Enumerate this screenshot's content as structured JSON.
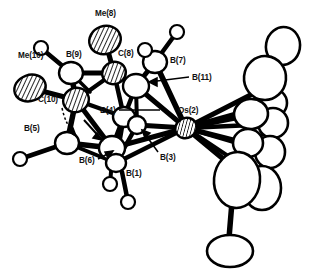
{
  "figure": {
    "name": "ortep-crystal-structure-diagram",
    "type": "molecular-structure-ortep",
    "background_color": "#ffffff",
    "line_color": "#000000",
    "caption": ""
  },
  "atom_labels": [
    {
      "id": "me8",
      "text": "Me(8)",
      "x": 95,
      "y": 16
    },
    {
      "id": "me10",
      "text": "Me(10)",
      "x": 18,
      "y": 58
    },
    {
      "id": "b9",
      "text": "B(9)",
      "x": 66,
      "y": 57
    },
    {
      "id": "c8",
      "text": "C(8)",
      "x": 118,
      "y": 56
    },
    {
      "id": "b7",
      "text": "B(7)",
      "x": 170,
      "y": 63
    },
    {
      "id": "b11",
      "text": "B(11)",
      "x": 192,
      "y": 80
    },
    {
      "id": "c10",
      "text": "C(10)",
      "x": 38,
      "y": 102
    },
    {
      "id": "b4",
      "text": "B(4)",
      "x": 100,
      "y": 113
    },
    {
      "id": "os2",
      "text": "Os(2)",
      "x": 178,
      "y": 113
    },
    {
      "id": "b5",
      "text": "B(5)",
      "x": 24,
      "y": 131
    },
    {
      "id": "b3",
      "text": "B(3)",
      "x": 160,
      "y": 160
    },
    {
      "id": "b6",
      "text": "B(6)",
      "x": 79,
      "y": 163
    },
    {
      "id": "b1",
      "text": "B(1)",
      "x": 126,
      "y": 176
    }
  ],
  "atoms": {
    "cage_boron": [
      {
        "id": "B9",
        "cx": 71,
        "cy": 73,
        "rx": 12,
        "ry": 11
      },
      {
        "id": "B7",
        "cx": 155,
        "cy": 62,
        "rx": 12,
        "ry": 11
      },
      {
        "id": "B11",
        "cx": 136,
        "cy": 86,
        "rx": 13,
        "ry": 12
      },
      {
        "id": "B4",
        "cx": 124,
        "cy": 117,
        "rx": 11,
        "ry": 10
      },
      {
        "id": "B5",
        "cx": 67,
        "cy": 143,
        "rx": 12,
        "ry": 11
      },
      {
        "id": "B6",
        "cx": 112,
        "cy": 148,
        "rx": 13,
        "ry": 12
      },
      {
        "id": "B1",
        "cx": 116,
        "cy": 163,
        "rx": 10,
        "ry": 9
      },
      {
        "id": "B3",
        "cx": 137,
        "cy": 125,
        "rx": 9,
        "ry": 9
      }
    ],
    "hatched_carbon": [
      {
        "id": "Me8",
        "cx": 105,
        "cy": 40,
        "rx": 16,
        "ry": 14,
        "rot": -20
      },
      {
        "id": "C8",
        "cx": 114,
        "cy": 73,
        "rx": 12,
        "ry": 11,
        "rot": -25
      },
      {
        "id": "Me10",
        "cx": 30,
        "cy": 88,
        "rx": 16,
        "ry": 13,
        "rot": -20
      },
      {
        "id": "C10",
        "cx": 76,
        "cy": 100,
        "rx": 13,
        "ry": 12,
        "rot": -25
      }
    ],
    "metal": {
      "id": "Os2",
      "cx": 186,
      "cy": 128,
      "rx": 11,
      "ry": 10,
      "rot": -30
    },
    "hydrogens": [
      {
        "id": "H-B9",
        "cx": 41,
        "cy": 48
      },
      {
        "id": "H-B7a",
        "cx": 177,
        "cy": 32
      },
      {
        "id": "H-B7b",
        "cx": 145,
        "cy": 50
      },
      {
        "id": "H-B5",
        "cx": 20,
        "cy": 159
      },
      {
        "id": "H-B6",
        "cx": 110,
        "cy": 184
      },
      {
        "id": "H-B1",
        "cx": 128,
        "cy": 202
      }
    ],
    "ligand_ellipsoids": [
      {
        "id": "L1",
        "cx": 283,
        "cy": 46,
        "rx": 17,
        "ry": 19,
        "rot": 10
      },
      {
        "id": "L2",
        "cx": 265,
        "cy": 78,
        "rx": 21,
        "ry": 22,
        "rot": 5
      },
      {
        "id": "L3",
        "cx": 271,
        "cy": 103,
        "rx": 16,
        "ry": 15,
        "rot": 0
      },
      {
        "id": "L4",
        "cx": 251,
        "cy": 114,
        "rx": 17,
        "ry": 15,
        "rot": -5
      },
      {
        "id": "L5",
        "cx": 273,
        "cy": 123,
        "rx": 15,
        "ry": 15,
        "rot": 0
      },
      {
        "id": "L6",
        "cx": 248,
        "cy": 143,
        "rx": 15,
        "ry": 14,
        "rot": 0
      },
      {
        "id": "L7",
        "cx": 270,
        "cy": 152,
        "rx": 15,
        "ry": 16,
        "rot": 0
      },
      {
        "id": "L8",
        "cx": 237,
        "cy": 180,
        "rx": 23,
        "ry": 28,
        "rot": 5
      },
      {
        "id": "L9",
        "cx": 262,
        "cy": 188,
        "rx": 19,
        "ry": 22,
        "rot": 0
      },
      {
        "id": "L10",
        "cx": 230,
        "cy": 251,
        "rx": 23,
        "ry": 16,
        "rot": 0
      }
    ]
  },
  "leader_lines": [
    {
      "id": "leader-b11",
      "from_label": "B(11)",
      "x1": 189,
      "y1": 77,
      "x2": 143,
      "y2": 82
    },
    {
      "id": "leader-b4",
      "from_label": "B(4)",
      "x1": 119,
      "y1": 110,
      "x2": 160,
      "y2": 110
    },
    {
      "id": "leader-b3",
      "from_label": "B(3)",
      "x1": 158,
      "y1": 152,
      "x2": 140,
      "y2": 128
    },
    {
      "id": "leader-b6",
      "from_label": "B(6)",
      "x1": 98,
      "y1": 159,
      "x2": 115,
      "y2": 150
    },
    {
      "id": "leader-c10",
      "from_label": "C(10)",
      "x1": 62,
      "y1": 108,
      "x2": 76,
      "y2": 135
    }
  ],
  "bonds": {
    "cage_bond_color": "#000000",
    "count_visible": 34
  }
}
